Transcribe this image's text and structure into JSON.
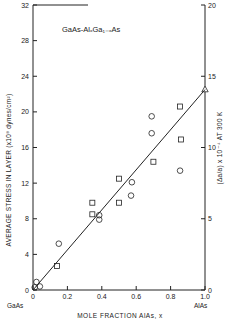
{
  "chart_data": {
    "type": "scatter",
    "title": "GaAs-AlₓGa₁₋ₓAs",
    "xlabel": "MOLE FRACTION AlAs, x",
    "ylabel": "AVERAGE STRESS IN LAYER (x10⁸ dynes/cm²)",
    "y2label": "(Δa/a) x 10⁻⁴ AT 300 K",
    "xlim": [
      0,
      1.0
    ],
    "ylim": [
      0,
      32
    ],
    "y2lim": [
      0,
      20
    ],
    "x_ticks": [
      "0",
      "0.2",
      "0.4",
      "0.6",
      "0.8",
      "1.0"
    ],
    "y_ticks": [
      "0",
      "4",
      "8",
      "12",
      "16",
      "20",
      "24",
      "28",
      "32"
    ],
    "y2_ticks": [
      "0",
      "5",
      "10",
      "15",
      "20"
    ],
    "x_end_labels": {
      "left": "GaAs",
      "right": "AlAs"
    },
    "grid": false,
    "series": [
      {
        "name": "squares",
        "marker": "square",
        "points": [
          [
            0.14,
            2.7
          ],
          [
            0.345,
            8.5
          ],
          [
            0.345,
            9.8
          ],
          [
            0.5,
            9.8
          ],
          [
            0.5,
            12.5
          ],
          [
            0.7,
            14.4
          ],
          [
            0.86,
            16.9
          ],
          [
            0.855,
            20.6
          ]
        ]
      },
      {
        "name": "circles",
        "marker": "circle",
        "points": [
          [
            0.02,
            0.9
          ],
          [
            0.01,
            0.3
          ],
          [
            0.04,
            0.4
          ],
          [
            0.15,
            5.2
          ],
          [
            0.385,
            7.9
          ],
          [
            0.385,
            8.4
          ],
          [
            0.57,
            10.6
          ],
          [
            0.575,
            12.1
          ],
          [
            0.69,
            17.6
          ],
          [
            0.69,
            19.5
          ],
          [
            0.855,
            13.4
          ]
        ]
      },
      {
        "name": "triangle",
        "marker": "triangle",
        "points": [
          [
            1.0,
            22.5
          ]
        ]
      },
      {
        "name": "fit line",
        "type": "line",
        "points": [
          [
            0.0,
            0.0
          ],
          [
            1.0,
            22.5
          ]
        ]
      }
    ]
  }
}
